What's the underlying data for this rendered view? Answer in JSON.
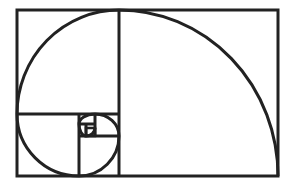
{
  "diagram": {
    "type": "golden-spiral",
    "stroke_color": "#222222",
    "background": "#ffffff",
    "outer_rect": {
      "x": 17,
      "y": 10,
      "w": 261,
      "h": 166
    },
    "squares": [
      {
        "x": 17,
        "y": 10,
        "w": 102,
        "h": 104
      },
      {
        "x": 119,
        "y": 10,
        "w": 159,
        "h": 166
      },
      {
        "x": 17,
        "y": 114,
        "w": 62,
        "h": 62
      },
      {
        "x": 79,
        "y": 136,
        "w": 40,
        "h": 40
      },
      {
        "x": 79,
        "y": 114,
        "w": 16,
        "h": 22
      },
      {
        "x": 95,
        "y": 114,
        "w": 24,
        "h": 22
      },
      {
        "x": 79,
        "y": 114,
        "w": 16,
        "h": 10
      }
    ]
  }
}
